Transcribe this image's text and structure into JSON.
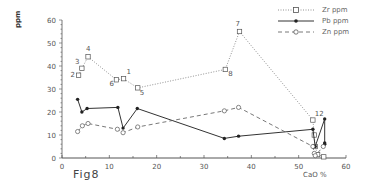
{
  "figure": {
    "label": "Fig8",
    "ylabel": "ppm",
    "xlabel": "CaO  %"
  },
  "legend": {
    "items": [
      {
        "label": "Zr ppm",
        "style": "dotted",
        "marker": "open-square"
      },
      {
        "label": "Pb ppm",
        "style": "solid",
        "marker": "filled-circle"
      },
      {
        "label": "Zn ppm",
        "style": "dashed",
        "marker": "open-circle"
      }
    ]
  },
  "chart_data": {
    "type": "line",
    "title": "Fig8",
    "xlabel": "CaO %",
    "ylabel": "ppm",
    "xlim": [
      0,
      60
    ],
    "ylim": [
      0,
      60
    ],
    "xticks": [
      0,
      10,
      20,
      30,
      40,
      50,
      60
    ],
    "yticks": [
      0,
      10,
      20,
      30,
      40,
      50,
      60
    ],
    "grid": false,
    "legend_position": "top-right",
    "series": [
      {
        "name": "Zr ppm",
        "style": "dotted",
        "marker": "open-square",
        "points": [
          {
            "x": 3.5,
            "y": 36,
            "label": "2"
          },
          {
            "x": 4.2,
            "y": 39,
            "label": "3"
          },
          {
            "x": 5.5,
            "y": 44,
            "label": "4"
          },
          {
            "x": 11.5,
            "y": 34,
            "label": "6"
          },
          {
            "x": 13.0,
            "y": 34.5,
            "label": "1"
          },
          {
            "x": 16.0,
            "y": 30.5,
            "label": "5"
          },
          {
            "x": 34.5,
            "y": 38.5,
            "label": "8"
          },
          {
            "x": 37.5,
            "y": 55,
            "label": "7"
          },
          {
            "x": 53.0,
            "y": 16.5,
            "label": "12"
          },
          {
            "x": 53.3,
            "y": 10,
            "label": ""
          },
          {
            "x": 53.5,
            "y": 5,
            "label": ""
          },
          {
            "x": 54.0,
            "y": 1.5,
            "label": ""
          },
          {
            "x": 55.3,
            "y": 0.5,
            "label": ""
          }
        ]
      },
      {
        "name": "Pb ppm",
        "style": "solid",
        "marker": "filled-circle",
        "points": [
          {
            "x": 3.3,
            "y": 25.5
          },
          {
            "x": 4.2,
            "y": 20
          },
          {
            "x": 5.3,
            "y": 21.5
          },
          {
            "x": 11.8,
            "y": 22
          },
          {
            "x": 12.9,
            "y": 13
          },
          {
            "x": 15.9,
            "y": 21.5
          },
          {
            "x": 34.3,
            "y": 8.5
          },
          {
            "x": 37.3,
            "y": 9.5
          },
          {
            "x": 53.0,
            "y": 12.5
          },
          {
            "x": 53.5,
            "y": 5
          },
          {
            "x": 55.5,
            "y": 17
          },
          {
            "x": 55.5,
            "y": 6.5
          },
          {
            "x": 55.5,
            "y": 6
          }
        ]
      },
      {
        "name": "Zn ppm",
        "style": "dashed",
        "marker": "open-circle",
        "points": [
          {
            "x": 3.3,
            "y": 11.5
          },
          {
            "x": 4.3,
            "y": 14
          },
          {
            "x": 5.5,
            "y": 15
          },
          {
            "x": 11.7,
            "y": 12.5
          },
          {
            "x": 12.9,
            "y": 11
          },
          {
            "x": 16.0,
            "y": 13.5
          },
          {
            "x": 34.3,
            "y": 20.5
          },
          {
            "x": 37.3,
            "y": 22
          },
          {
            "x": 53.0,
            "y": 5
          },
          {
            "x": 53.3,
            "y": 2
          },
          {
            "x": 53.5,
            "y": 1
          },
          {
            "x": 55.2,
            "y": 5
          }
        ]
      }
    ]
  }
}
